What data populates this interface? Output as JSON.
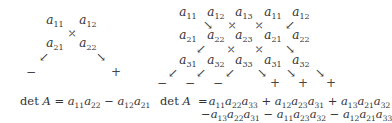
{
  "left_diagram": {
    "elements": [
      {
        "base": "a",
        "sub": "11",
        "x": 55,
        "y": 21
      },
      {
        "base": "a",
        "sub": "12",
        "x": 88,
        "y": 21
      },
      {
        "base": "a",
        "sub": "21",
        "x": 55,
        "y": 44
      },
      {
        "base": "a",
        "sub": "22",
        "x": 88,
        "y": 44
      }
    ],
    "arrows": [
      {
        "glyph": "⤡",
        "x": 72,
        "y": 33,
        "kind": "cross"
      },
      {
        "glyph": "↙",
        "x": 44,
        "y": 57,
        "kind": "arrow"
      },
      {
        "glyph": "↘",
        "x": 101,
        "y": 57,
        "kind": "arrow"
      }
    ],
    "signs": [
      {
        "glyph": "−",
        "x": 31,
        "y": 72
      },
      {
        "glyph": "+",
        "x": 116,
        "y": 72
      }
    ],
    "formula": {
      "lhs": "det A =",
      "terms": [
        "a11a22",
        "− a12a21"
      ]
    }
  },
  "right_diagram": {
    "rows": [
      {
        "y": 13,
        "elements": [
          [
            "a",
            "11"
          ],
          [
            "a",
            "12"
          ],
          [
            "a",
            "13"
          ],
          [
            "a",
            "11"
          ],
          [
            "a",
            "12"
          ]
        ]
      },
      {
        "y": 36,
        "elements": [
          [
            "a",
            "21"
          ],
          [
            "a",
            "22"
          ],
          [
            "a",
            "23"
          ],
          [
            "a",
            "21"
          ],
          [
            "a",
            "22"
          ]
        ]
      },
      {
        "y": 61,
        "elements": [
          [
            "a",
            "31"
          ],
          [
            "a",
            "32"
          ],
          [
            "a",
            "33"
          ],
          [
            "a",
            "31"
          ],
          [
            "a",
            "32"
          ]
        ]
      }
    ],
    "columns_x": [
      188,
      216,
      244,
      273,
      301
    ],
    "arrows": [
      {
        "glyph": "↘",
        "x": 208,
        "y": 25,
        "kind": "arrow"
      },
      {
        "glyph": "⤡",
        "x": 232,
        "y": 25,
        "kind": "cross"
      },
      {
        "glyph": "⤡",
        "x": 259,
        "y": 25,
        "kind": "cross"
      },
      {
        "glyph": "↙",
        "x": 290,
        "y": 25,
        "kind": "arrow"
      },
      {
        "glyph": "↙",
        "x": 201,
        "y": 49,
        "kind": "arrow"
      },
      {
        "glyph": "⤡",
        "x": 231,
        "y": 49,
        "kind": "cross"
      },
      {
        "glyph": "⤡",
        "x": 259,
        "y": 49,
        "kind": "cross"
      },
      {
        "glyph": "↘",
        "x": 290,
        "y": 49,
        "kind": "arrow"
      },
      {
        "glyph": "↙",
        "x": 173,
        "y": 73,
        "kind": "arrow"
      },
      {
        "glyph": "↙",
        "x": 201,
        "y": 73,
        "kind": "arrow"
      },
      {
        "glyph": "↙",
        "x": 230,
        "y": 73,
        "kind": "arrow"
      },
      {
        "glyph": "↘",
        "x": 262,
        "y": 73,
        "kind": "arrow"
      },
      {
        "glyph": "↘",
        "x": 291,
        "y": 73,
        "kind": "arrow"
      },
      {
        "glyph": "↘",
        "x": 320,
        "y": 73,
        "kind": "arrow"
      }
    ],
    "signs": [
      {
        "glyph": "−",
        "x": 162,
        "y": 83
      },
      {
        "glyph": "−",
        "x": 190,
        "y": 83
      },
      {
        "glyph": "−",
        "x": 218,
        "y": 83
      },
      {
        "glyph": "+",
        "x": 275,
        "y": 83
      },
      {
        "glyph": "+",
        "x": 303,
        "y": 83
      },
      {
        "glyph": "+",
        "x": 331,
        "y": 83
      }
    ],
    "formula": {
      "lhs": "det A  =",
      "line1": [
        "a11a22a33",
        "+ a12a23a31",
        "+ a13a21a32"
      ],
      "line2": [
        "−a13a22a31",
        "− a11a23a32",
        "− a12a21a33"
      ]
    }
  }
}
